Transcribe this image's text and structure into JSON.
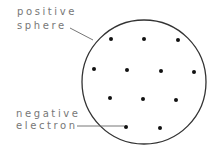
{
  "diagram": {
    "labels": {
      "sphere_line1": "positive",
      "sphere_line2": "sphere",
      "electron_line1": "negative",
      "electron_line2": "electron"
    },
    "sphere": {
      "cx": 144,
      "cy": 82,
      "r": 62,
      "stroke": "#333333"
    },
    "electrons": [
      {
        "x": 111,
        "y": 39
      },
      {
        "x": 144,
        "y": 39
      },
      {
        "x": 178,
        "y": 40
      },
      {
        "x": 94,
        "y": 69
      },
      {
        "x": 127,
        "y": 70
      },
      {
        "x": 161,
        "y": 71
      },
      {
        "x": 194,
        "y": 72
      },
      {
        "x": 110,
        "y": 98
      },
      {
        "x": 143,
        "y": 99
      },
      {
        "x": 176,
        "y": 100
      },
      {
        "x": 126,
        "y": 127
      },
      {
        "x": 160,
        "y": 128
      }
    ],
    "electron_color": "#111111",
    "label_color": "#777777"
  }
}
